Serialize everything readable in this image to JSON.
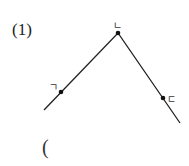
{
  "problem": {
    "number_label": "(1)",
    "answer_paren": "("
  },
  "diagram": {
    "type": "bent-line",
    "line_color": "#222222",
    "points": [
      {
        "name": "start",
        "x": 44,
        "y": 110
      },
      {
        "name": "ㄱ",
        "x": 61,
        "y": 92,
        "label": "ㄱ",
        "label_x": 49,
        "label_y": 87
      },
      {
        "name": "ㄴ",
        "x": 118,
        "y": 33,
        "label": "ㄴ",
        "label_x": 113,
        "label_y": 27
      },
      {
        "name": "ㄷ",
        "x": 163,
        "y": 98,
        "label": "ㄷ",
        "label_x": 167,
        "label_y": 102
      },
      {
        "name": "end",
        "x": 180,
        "y": 123
      }
    ]
  }
}
